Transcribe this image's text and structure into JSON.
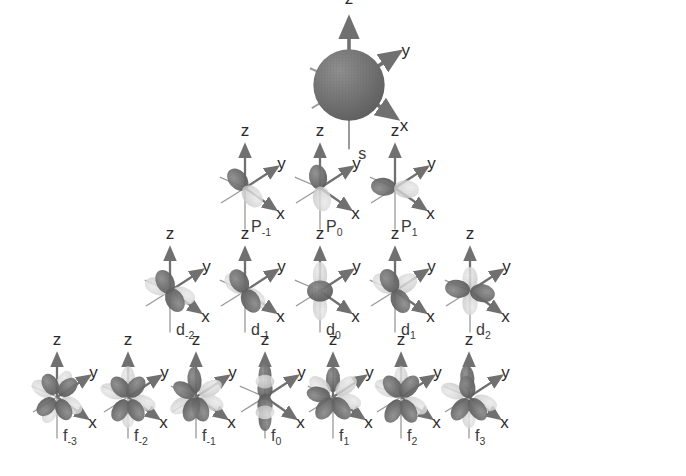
{
  "figure": {
    "title": "",
    "background_color": "#ffffff",
    "axis_labels": {
      "z": "z",
      "y": "y",
      "x": "x"
    },
    "colors": {
      "lobe_dark": "#6e6e6e",
      "lobe_light": "#d4d4d4",
      "arrow": "#707070",
      "axis_line": "#8a8a8a",
      "text": "#2b2b2b",
      "label_text": "#3a3a3a"
    }
  },
  "rows": [
    {
      "name": "s-row",
      "shell": "s",
      "center_y": 85,
      "scale": 1.55,
      "orbitals": [
        {
          "label": "s",
          "sub": "",
          "cx": 349,
          "type": "sphere"
        }
      ]
    },
    {
      "name": "p-row",
      "shell": "p",
      "center_y": 188,
      "scale": 1.0,
      "orbitals": [
        {
          "label": "P",
          "sub": "-1",
          "cx": 245,
          "type": "p-diag"
        },
        {
          "label": "P",
          "sub": "0",
          "cx": 320,
          "type": "p-vert"
        },
        {
          "label": "P",
          "sub": "1",
          "cx": 395,
          "type": "p-horiz"
        }
      ]
    },
    {
      "name": "d-row",
      "shell": "d",
      "center_y": 291,
      "scale": 1.0,
      "orbitals": [
        {
          "label": "d",
          "sub": "-2",
          "cx": 170,
          "type": "d-xy"
        },
        {
          "label": "d",
          "sub": "-1",
          "cx": 245,
          "type": "d-yz"
        },
        {
          "label": "d",
          "sub": "0",
          "cx": 320,
          "type": "d-z2"
        },
        {
          "label": "d",
          "sub": "1",
          "cx": 395,
          "type": "d-xz"
        },
        {
          "label": "d",
          "sub": "2",
          "cx": 470,
          "type": "d-x2y2"
        }
      ]
    },
    {
      "name": "f-row",
      "shell": "f",
      "center_y": 397,
      "scale": 1.0,
      "orbitals": [
        {
          "label": "f",
          "sub": "-3",
          "cx": 57,
          "type": "f-a"
        },
        {
          "label": "f",
          "sub": "-2",
          "cx": 128,
          "type": "f-b"
        },
        {
          "label": "f",
          "sub": "-1",
          "cx": 196,
          "type": "f-c"
        },
        {
          "label": "f",
          "sub": "0",
          "cx": 265,
          "type": "f-z3"
        },
        {
          "label": "f",
          "sub": "1",
          "cx": 333,
          "type": "f-d"
        },
        {
          "label": "f",
          "sub": "2",
          "cx": 401,
          "type": "f-e"
        },
        {
          "label": "f",
          "sub": "3",
          "cx": 469,
          "type": "f-f"
        }
      ]
    }
  ]
}
